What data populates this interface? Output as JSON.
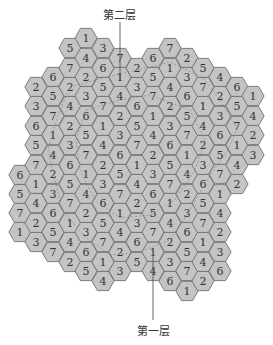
{
  "labels": {
    "top": "第二层",
    "bottom": "第一层"
  },
  "colors": {
    "hex_fill": "#c4c4c4",
    "hex_stroke": "#6e6e6e",
    "text": "#333333",
    "pointer_line": "#555555",
    "dashed_boundary": "#7a7a7a"
  },
  "grid": {
    "hex_radius": 11.1,
    "col_spacing": 16.65,
    "row_spacing": 19.4,
    "columns": [
      {
        "x": 20,
        "cells": [
          {
            "y": 175,
            "v": "6"
          },
          {
            "y": 194,
            "v": "5"
          },
          {
            "y": 213,
            "v": "7"
          },
          {
            "y": 232,
            "v": "1"
          }
        ]
      },
      {
        "x": 36,
        "cells": [
          {
            "y": 87,
            "v": "2"
          },
          {
            "y": 106,
            "v": "3"
          },
          {
            "y": 126,
            "v": "6"
          },
          {
            "y": 145,
            "v": "5"
          },
          {
            "y": 165,
            "v": "7"
          },
          {
            "y": 184,
            "v": "1"
          },
          {
            "y": 203,
            "v": "4"
          },
          {
            "y": 223,
            "v": "2"
          },
          {
            "y": 242,
            "v": "3"
          }
        ]
      },
      {
        "x": 53,
        "cells": [
          {
            "y": 77,
            "v": "6"
          },
          {
            "y": 96,
            "v": "5"
          },
          {
            "y": 116,
            "v": "7"
          },
          {
            "y": 135,
            "v": "1"
          },
          {
            "y": 155,
            "v": "4"
          },
          {
            "y": 174,
            "v": "2"
          },
          {
            "y": 194,
            "v": "3"
          },
          {
            "y": 213,
            "v": "6"
          },
          {
            "y": 232,
            "v": "5"
          },
          {
            "y": 252,
            "v": "7"
          }
        ]
      },
      {
        "x": 70,
        "cells": [
          {
            "y": 48,
            "v": "5"
          },
          {
            "y": 68,
            "v": "7"
          },
          {
            "y": 87,
            "v": "2"
          },
          {
            "y": 106,
            "v": "4"
          },
          {
            "y": 126,
            "v": "2"
          },
          {
            "y": 145,
            "v": "3"
          },
          {
            "y": 165,
            "v": "6"
          },
          {
            "y": 184,
            "v": "5"
          },
          {
            "y": 203,
            "v": "7"
          },
          {
            "y": 223,
            "v": "1"
          },
          {
            "y": 242,
            "v": "4"
          },
          {
            "y": 262,
            "v": "2"
          }
        ]
      },
      {
        "x": 86,
        "cells": [
          {
            "y": 38,
            "v": "1"
          },
          {
            "y": 58,
            "v": "4"
          },
          {
            "y": 77,
            "v": "2"
          },
          {
            "y": 96,
            "v": "3"
          },
          {
            "y": 116,
            "v": "6"
          },
          {
            "y": 135,
            "v": "5"
          },
          {
            "y": 155,
            "v": "7"
          },
          {
            "y": 174,
            "v": "1"
          },
          {
            "y": 194,
            "v": "4"
          },
          {
            "y": 213,
            "v": "2"
          },
          {
            "y": 232,
            "v": "3"
          },
          {
            "y": 252,
            "v": "6"
          },
          {
            "y": 271,
            "v": "5"
          }
        ]
      },
      {
        "x": 103,
        "cells": [
          {
            "y": 48,
            "v": "3"
          },
          {
            "y": 68,
            "v": "6"
          },
          {
            "y": 87,
            "v": "5"
          },
          {
            "y": 106,
            "v": "7"
          },
          {
            "y": 126,
            "v": "1"
          },
          {
            "y": 145,
            "v": "4"
          },
          {
            "y": 165,
            "v": "2"
          },
          {
            "y": 184,
            "v": "3"
          },
          {
            "y": 203,
            "v": "6"
          },
          {
            "y": 223,
            "v": "5"
          },
          {
            "y": 242,
            "v": "7"
          },
          {
            "y": 262,
            "v": "1"
          },
          {
            "y": 281,
            "v": "4"
          }
        ]
      },
      {
        "x": 120,
        "cells": [
          {
            "y": 58,
            "v": "7"
          },
          {
            "y": 77,
            "v": "1"
          },
          {
            "y": 96,
            "v": "4"
          },
          {
            "y": 116,
            "v": "2"
          },
          {
            "y": 135,
            "v": "3"
          },
          {
            "y": 155,
            "v": "6"
          },
          {
            "y": 174,
            "v": "5"
          },
          {
            "y": 194,
            "v": "7"
          },
          {
            "y": 213,
            "v": "1"
          },
          {
            "y": 232,
            "v": "4"
          },
          {
            "y": 252,
            "v": "2"
          },
          {
            "y": 271,
            "v": "3"
          }
        ]
      },
      {
        "x": 137,
        "cells": [
          {
            "y": 68,
            "v": "2"
          },
          {
            "y": 87,
            "v": "3"
          },
          {
            "y": 106,
            "v": "6"
          },
          {
            "y": 126,
            "v": "5"
          },
          {
            "y": 145,
            "v": "7"
          },
          {
            "y": 165,
            "v": "1"
          },
          {
            "y": 184,
            "v": "4"
          },
          {
            "y": 203,
            "v": "2"
          },
          {
            "y": 223,
            "v": "3"
          },
          {
            "y": 242,
            "v": "6"
          },
          {
            "y": 262,
            "v": "5"
          }
        ]
      },
      {
        "x": 153,
        "cells": [
          {
            "y": 58,
            "v": "6"
          },
          {
            "y": 77,
            "v": "5"
          },
          {
            "y": 96,
            "v": "7"
          },
          {
            "y": 116,
            "v": "1"
          },
          {
            "y": 135,
            "v": "4"
          },
          {
            "y": 155,
            "v": "2"
          },
          {
            "y": 174,
            "v": "3"
          },
          {
            "y": 194,
            "v": "6"
          },
          {
            "y": 213,
            "v": "5"
          },
          {
            "y": 232,
            "v": "7"
          },
          {
            "y": 252,
            "v": "1"
          },
          {
            "y": 271,
            "v": "4"
          }
        ]
      },
      {
        "x": 170,
        "cells": [
          {
            "y": 48,
            "v": "7"
          },
          {
            "y": 68,
            "v": "1"
          },
          {
            "y": 87,
            "v": "4"
          },
          {
            "y": 106,
            "v": "2"
          },
          {
            "y": 126,
            "v": "3"
          },
          {
            "y": 145,
            "v": "6"
          },
          {
            "y": 165,
            "v": "5"
          },
          {
            "y": 184,
            "v": "7"
          },
          {
            "y": 203,
            "v": "1"
          },
          {
            "y": 223,
            "v": "4"
          },
          {
            "y": 242,
            "v": "2"
          },
          {
            "y": 262,
            "v": "3"
          },
          {
            "y": 281,
            "v": "6"
          }
        ]
      },
      {
        "x": 187,
        "cells": [
          {
            "y": 58,
            "v": "2"
          },
          {
            "y": 77,
            "v": "3"
          },
          {
            "y": 96,
            "v": "6"
          },
          {
            "y": 116,
            "v": "5"
          },
          {
            "y": 135,
            "v": "7"
          },
          {
            "y": 155,
            "v": "1"
          },
          {
            "y": 174,
            "v": "4"
          },
          {
            "y": 194,
            "v": "2"
          },
          {
            "y": 213,
            "v": "3"
          },
          {
            "y": 232,
            "v": "6"
          },
          {
            "y": 252,
            "v": "5"
          },
          {
            "y": 271,
            "v": "7"
          },
          {
            "y": 291,
            "v": "1"
          }
        ]
      },
      {
        "x": 203,
        "cells": [
          {
            "y": 68,
            "v": "5"
          },
          {
            "y": 87,
            "v": "7"
          },
          {
            "y": 106,
            "v": "1"
          },
          {
            "y": 126,
            "v": "4"
          },
          {
            "y": 145,
            "v": "2"
          },
          {
            "y": 165,
            "v": "3"
          },
          {
            "y": 184,
            "v": "6"
          },
          {
            "y": 203,
            "v": "5"
          },
          {
            "y": 223,
            "v": "7"
          },
          {
            "y": 242,
            "v": "1"
          },
          {
            "y": 262,
            "v": "4"
          },
          {
            "y": 281,
            "v": "2"
          }
        ]
      },
      {
        "x": 220,
        "cells": [
          {
            "y": 77,
            "v": "4"
          },
          {
            "y": 96,
            "v": "2"
          },
          {
            "y": 116,
            "v": "3"
          },
          {
            "y": 135,
            "v": "6"
          },
          {
            "y": 155,
            "v": "5"
          },
          {
            "y": 174,
            "v": "7"
          },
          {
            "y": 194,
            "v": "1"
          },
          {
            "y": 213,
            "v": "4"
          },
          {
            "y": 232,
            "v": "2"
          },
          {
            "y": 252,
            "v": "3"
          },
          {
            "y": 271,
            "v": "6"
          }
        ]
      },
      {
        "x": 237,
        "cells": [
          {
            "y": 87,
            "v": "6"
          },
          {
            "y": 106,
            "v": "5"
          },
          {
            "y": 126,
            "v": "7"
          },
          {
            "y": 145,
            "v": "1"
          },
          {
            "y": 165,
            "v": "4"
          },
          {
            "y": 184,
            "v": "2"
          }
        ]
      },
      {
        "x": 253,
        "cells": [
          {
            "y": 96,
            "v": "1"
          },
          {
            "y": 116,
            "v": "4"
          },
          {
            "y": 135,
            "v": "2"
          },
          {
            "y": 155,
            "v": "3"
          }
        ]
      }
    ]
  },
  "pointers": {
    "top": {
      "x": 120,
      "y1": 22,
      "y2": 80
    },
    "bottom": {
      "x": 153,
      "y1": 255,
      "y2": 320
    }
  }
}
